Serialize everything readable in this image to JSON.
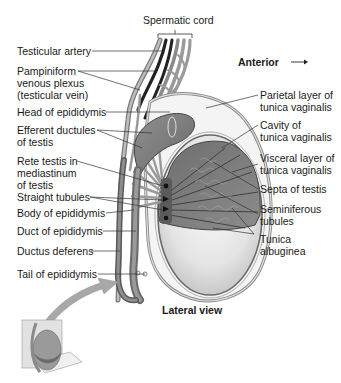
{
  "figure": {
    "view_label": "Lateral view",
    "orientation_label": "Anterior",
    "orientation_arrow": "→",
    "colors": {
      "tissue_dark": "#555555",
      "tissue_mid": "#8a8a8a",
      "tissue_light": "#c9c9c9",
      "albuginea_fill": "#e6e6e6",
      "leader_line": "#333333",
      "arrow_fill": "#a8a8a8"
    }
  },
  "labels_left": [
    {
      "id": "spermatic-cord",
      "text": "Spermatic cord"
    },
    {
      "id": "testicular-artery",
      "text": "Testicular artery"
    },
    {
      "id": "pampiniform-plexus",
      "text": "Pampiniform\nvenous plexus\n(testicular vein)"
    },
    {
      "id": "head-of-epididymis",
      "text": "Head of epididymis"
    },
    {
      "id": "efferent-ductules",
      "text": "Efferent ductules\nof testis"
    },
    {
      "id": "rete-testis",
      "text": "Rete testis in\nmediastinum\nof testis"
    },
    {
      "id": "straight-tubules",
      "text": "Straight tubules"
    },
    {
      "id": "body-of-epididymis",
      "text": "Body of epididymis"
    },
    {
      "id": "duct-of-epididymis",
      "text": "Duct of epididymis"
    },
    {
      "id": "ductus-deferens",
      "text": "Ductus deferens"
    },
    {
      "id": "tail-of-epididymis",
      "text": "Tail of epididymis"
    }
  ],
  "labels_right": [
    {
      "id": "parietal-layer",
      "text": "Parietal layer of\ntunica vaginalis"
    },
    {
      "id": "cavity",
      "text": "Cavity of\ntunica vaginalis"
    },
    {
      "id": "visceral-layer",
      "text": "Visceral layer of\ntunica vaginalis"
    },
    {
      "id": "septa",
      "text": "Septa of testis"
    },
    {
      "id": "seminiferous-tubules",
      "text": "Seminiferous\ntubules"
    },
    {
      "id": "tunica-albuginea",
      "text": "Tunica\nalbuginea"
    }
  ]
}
